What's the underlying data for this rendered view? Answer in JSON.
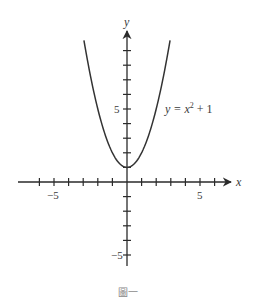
{
  "chart_data": {
    "type": "line",
    "title": "",
    "function": "y = x^2 + 1",
    "series": [
      {
        "name": "y = x² + 1",
        "x": [
          -2.95,
          -2.5,
          -2,
          -1.5,
          -1,
          -0.5,
          0,
          0.5,
          1,
          1.5,
          2,
          2.5,
          2.95
        ],
        "values": [
          9.7,
          7.25,
          5,
          3.25,
          2,
          1.25,
          1,
          1.25,
          2,
          3.25,
          5,
          7.25,
          9.7
        ]
      }
    ],
    "xlabel": "x",
    "ylabel": "y",
    "xlim": [
      -7.4,
      7.2
    ],
    "ylim": [
      -5.8,
      10.4
    ],
    "x_ticks": [
      -6,
      -5,
      -4,
      -3,
      -2,
      -1,
      1,
      2,
      3,
      4,
      5,
      6
    ],
    "y_ticks": [
      -5,
      -4,
      -3,
      -2,
      -1,
      1,
      2,
      3,
      4,
      5,
      6,
      7,
      8,
      9
    ],
    "x_tick_labels": {
      "-5": "−5",
      "5": "5"
    },
    "y_tick_labels": {
      "-5": "−5",
      "5": "5"
    },
    "annotations": [
      {
        "text": "y = x² + 1",
        "x": 2.7,
        "y": 5
      }
    ],
    "grid": false,
    "legend": "none"
  },
  "labels": {
    "x_axis": "x",
    "y_axis": "y",
    "x_neg5": "−5",
    "x_pos5": "5",
    "y_pos5": "5",
    "y_neg5": "−5",
    "curve_label_prefix": "y = x",
    "curve_label_exp": "2",
    "curve_label_suffix": " + 1"
  },
  "caption": "圖一",
  "colors": {
    "axis": "#2a2a2a",
    "curve": "#333333",
    "caption": "#888888"
  }
}
